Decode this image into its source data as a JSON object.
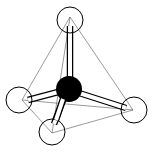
{
  "diagram": {
    "type": "tetrahedral-molecule",
    "colors": {
      "background": "#ffffff",
      "stroke": "#000000",
      "central_atom": "#000000",
      "outer_atom": "#ffffff",
      "edge": "#555555"
    },
    "central_atom": {
      "cx": 69,
      "cy": 89,
      "r": 13
    },
    "outer_atoms": [
      {
        "name": "top",
        "cx": 70,
        "cy": 20,
        "r": 13
      },
      {
        "name": "left",
        "cx": 19,
        "cy": 100,
        "r": 13
      },
      {
        "name": "right",
        "cx": 134,
        "cy": 110,
        "r": 13
      },
      {
        "name": "bottom",
        "cx": 52,
        "cy": 132,
        "r": 13
      }
    ],
    "vertices": {
      "top": [
        70,
        17
      ],
      "left": [
        22,
        100
      ],
      "right": [
        133,
        110
      ],
      "bottom": [
        52,
        133
      ]
    }
  }
}
